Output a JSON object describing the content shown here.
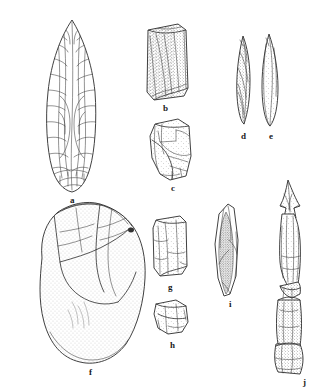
{
  "figure": {
    "kind": "archaeological-illustration-plate",
    "background_color": "#ffffff",
    "ink_color": "#2b2b2b",
    "label_color": "#1a1a1a",
    "width_px": 324,
    "height_px": 389
  },
  "artifacts": [
    {
      "id": "a",
      "label": "a",
      "name": "bifacial-leaf-point",
      "description": "Large bifacially flaked leaf-shaped point with full flake-scar pattern",
      "label_x": 70,
      "label_y": 196
    },
    {
      "id": "b",
      "label": "b",
      "name": "rectangular-flake-block",
      "description": "Blocky rectangular flake with shaded dorsal surface",
      "label_x": 163,
      "label_y": 104
    },
    {
      "id": "c",
      "label": "c",
      "name": "flake-core-fragment",
      "description": "Irregular flake core fragment with multiple removal scars",
      "label_x": 171,
      "label_y": 184
    },
    {
      "id": "d",
      "label": "d",
      "name": "narrow-bone-point-d",
      "description": "Slender pointed bone/antler sliver, twisted profile",
      "label_x": 241,
      "label_y": 132
    },
    {
      "id": "e",
      "label": "e",
      "name": "narrow-bone-point-e",
      "description": "Slender leaf-shaped point with stippled interior",
      "label_x": 269,
      "label_y": 132
    },
    {
      "id": "f",
      "label": "f",
      "name": "large-core-chopper",
      "description": "Large heavily stippled core or chopper with broad flake removals",
      "label_x": 89,
      "label_y": 368
    },
    {
      "id": "g",
      "label": "g",
      "name": "rectangular-blade-g",
      "description": "Small rectangular blade / flake tool",
      "label_x": 168,
      "label_y": 283
    },
    {
      "id": "h",
      "label": "h",
      "name": "small-flake-fragment-h",
      "description": "Small irregular flake fragment",
      "label_x": 170,
      "label_y": 341
    },
    {
      "id": "i",
      "label": "i",
      "name": "elongated-point-i",
      "description": "Long narrow point with dark stippled medial ridge",
      "label_x": 229,
      "label_y": 300
    },
    {
      "id": "j",
      "label": "j",
      "name": "barbed-composite-point-j",
      "description": "Long barbed composite point, broken into sections",
      "label_x": 303,
      "label_y": 381
    }
  ]
}
